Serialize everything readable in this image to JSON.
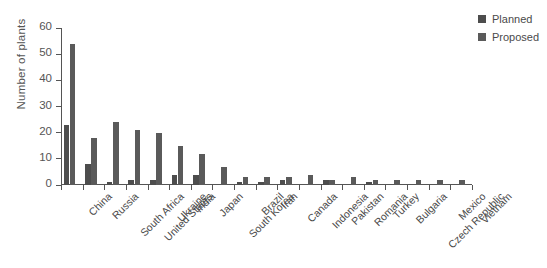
{
  "chart_data": {
    "type": "bar",
    "title": "",
    "xlabel": "",
    "ylabel": "Number of plants",
    "ylim": [
      0,
      60
    ],
    "yticks": [
      0,
      10,
      20,
      30,
      40,
      50,
      60
    ],
    "grid": false,
    "legend_position": "top-right",
    "categories": [
      "China",
      "Russia",
      "South Africa",
      "United States",
      "Ukraine",
      "India",
      "Japan",
      "South Korea",
      "Brazil",
      "Iran",
      "Canada",
      "Indonesia",
      "Pakistan",
      "Romania",
      "Turkey",
      "Bulgaria",
      "Czech Republic",
      "Mexico",
      "Vietnam"
    ],
    "series": [
      {
        "name": "Planned",
        "color": "#4d4d4d",
        "values": [
          23,
          8,
          1,
          2,
          2,
          4,
          4,
          0,
          1,
          1,
          2,
          0,
          2,
          0,
          1,
          0,
          0,
          0,
          0
        ]
      },
      {
        "name": "Proposed",
        "color": "#5a5a5a",
        "values": [
          54,
          18,
          24,
          21,
          20,
          15,
          12,
          7,
          3,
          3,
          3,
          4,
          2,
          3,
          2,
          2,
          2,
          2,
          2
        ]
      }
    ]
  },
  "legend": {
    "entries": [
      {
        "label": "Planned",
        "swatch": "#4d4d4d"
      },
      {
        "label": "Proposed",
        "swatch": "#5a5a5a"
      }
    ]
  },
  "axes": {
    "y_title": "Number of plants",
    "y_tick_labels": [
      "0",
      "10",
      "20",
      "30",
      "40",
      "50",
      "60"
    ]
  }
}
